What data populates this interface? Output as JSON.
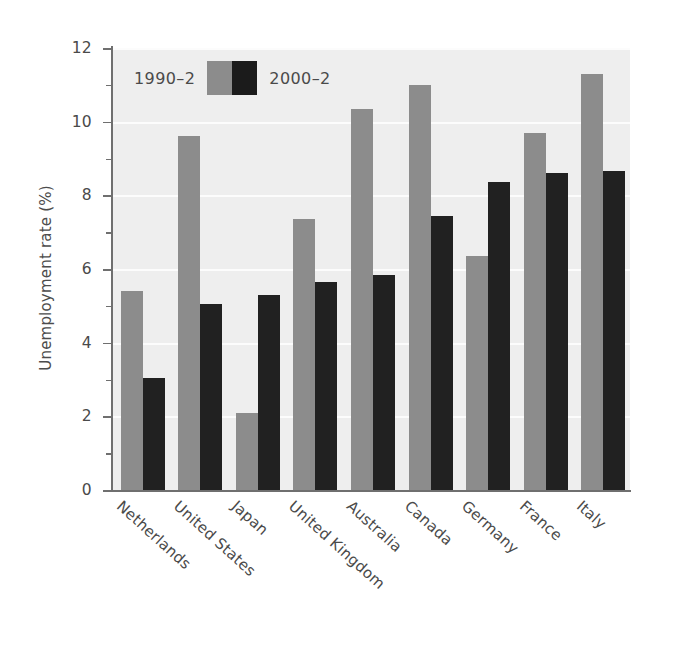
{
  "chart_data": {
    "type": "bar",
    "title": "",
    "xlabel": "",
    "ylabel": "Unemployment rate (%)",
    "ylim": [
      0,
      12
    ],
    "yticks": [
      0,
      2,
      4,
      6,
      8,
      10,
      12
    ],
    "ytick_labels": [
      "0",
      "2",
      "4",
      "6",
      "8",
      "10",
      "12"
    ],
    "minor_ticks": [
      1,
      3,
      5,
      7,
      9,
      11
    ],
    "grid": "horizontal-white",
    "legend_position": "top-left-inside",
    "categories": [
      "Netherlands",
      "United States",
      "Japan",
      "United Kingdom",
      "Australia",
      "Canada",
      "Germany",
      "France",
      "Italy"
    ],
    "series": [
      {
        "name": "1990–2",
        "color": "#8c8c8c",
        "values": [
          5.4,
          9.6,
          2.1,
          7.35,
          10.35,
          11.0,
          6.35,
          9.7,
          11.3
        ]
      },
      {
        "name": "2000–2",
        "color": "#1b1b1b",
        "values": [
          3.05,
          5.05,
          5.3,
          5.65,
          5.85,
          7.45,
          8.35,
          8.6,
          8.65
        ]
      }
    ]
  },
  "legend": {
    "left_label": "1990–2",
    "right_label": "2000–2"
  },
  "colors": {
    "series_1990": "#8c8c8c",
    "series_2000": "#1b1b1b",
    "plot_background": "#eeeeee",
    "gridline": "#fcfcfc",
    "axis": "#6f6f6f",
    "text": "#4a4a4a"
  }
}
